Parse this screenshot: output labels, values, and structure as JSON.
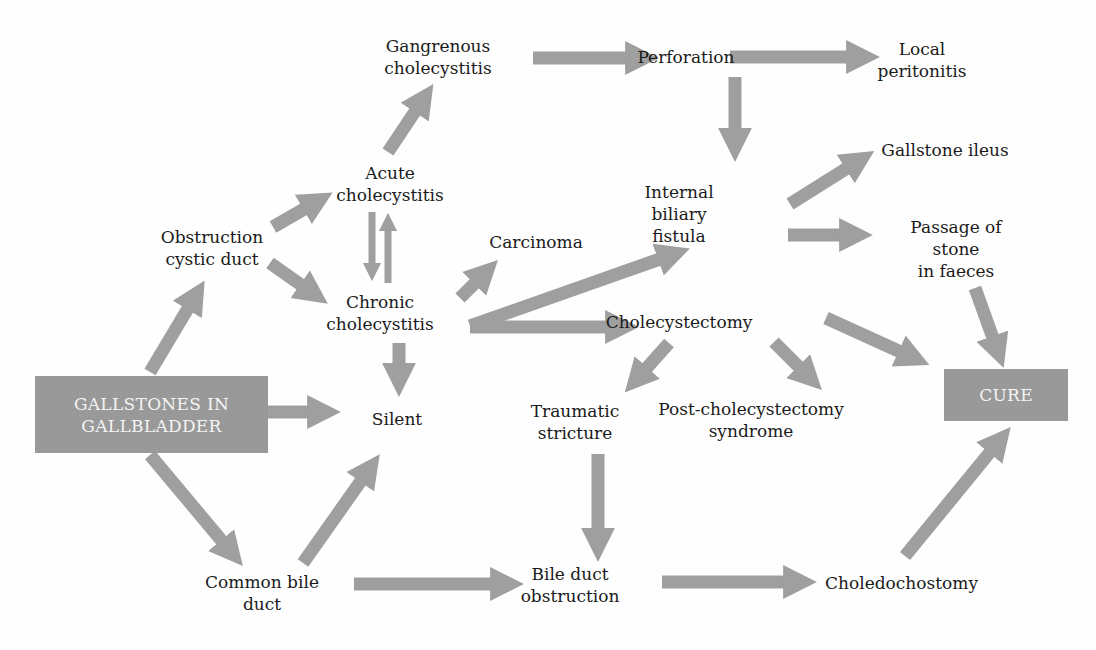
{
  "diagram": {
    "arrow_color": "#9f9f9f",
    "box_color": "#999999",
    "nodes": {
      "gallstones": "GALLSTONES IN\nGALLBLADDER",
      "obstruction_cystic": "Obstruction\ncystic duct",
      "acute": "Acute\ncholecystitis",
      "gangrenous": "Gangrenous\ncholecystitis",
      "perforation": "Perforation",
      "local_peritonitis": "Local\nperitonitis",
      "chronic": "Chronic\ncholecystitis",
      "carcinoma": "Carcinoma",
      "silent": "Silent",
      "internal_fistula": "Internal\nbiliary\nfistula",
      "gallstone_ileus": "Gallstone ileus",
      "passage_stone": "Passage of stone\nin faeces",
      "cholecystectomy": "Cholecystectomy",
      "traumatic_stricture": "Traumatic\nstricture",
      "post_chole": "Post-cholecystectomy\nsyndrome",
      "cure": "CURE",
      "common_bile_duct": "Common bile\nduct",
      "bile_duct_obstruction": "Bile duct\nobstruction",
      "choledochostomy": "Choledochostomy"
    },
    "edges": [
      [
        "gallstones",
        "obstruction_cystic"
      ],
      [
        "gallstones",
        "silent"
      ],
      [
        "gallstones",
        "common_bile_duct"
      ],
      [
        "obstruction_cystic",
        "acute"
      ],
      [
        "obstruction_cystic",
        "chronic"
      ],
      [
        "acute",
        "gangrenous"
      ],
      [
        "acute",
        "chronic"
      ],
      [
        "chronic",
        "acute"
      ],
      [
        "chronic",
        "carcinoma"
      ],
      [
        "chronic",
        "silent"
      ],
      [
        "chronic",
        "internal_fistula"
      ],
      [
        "chronic",
        "cholecystectomy"
      ],
      [
        "gangrenous",
        "perforation"
      ],
      [
        "perforation",
        "local_peritonitis"
      ],
      [
        "perforation",
        "internal_fistula"
      ],
      [
        "internal_fistula",
        "gallstone_ileus"
      ],
      [
        "internal_fistula",
        "passage_stone"
      ],
      [
        "passage_stone",
        "cure"
      ],
      [
        "cholecystectomy",
        "traumatic_stricture"
      ],
      [
        "cholecystectomy",
        "post_chole"
      ],
      [
        "cholecystectomy",
        "cure"
      ],
      [
        "traumatic_stricture",
        "bile_duct_obstruction"
      ],
      [
        "common_bile_duct",
        "silent"
      ],
      [
        "common_bile_duct",
        "bile_duct_obstruction"
      ],
      [
        "bile_duct_obstruction",
        "choledochostomy"
      ],
      [
        "choledochostomy",
        "cure"
      ]
    ]
  }
}
